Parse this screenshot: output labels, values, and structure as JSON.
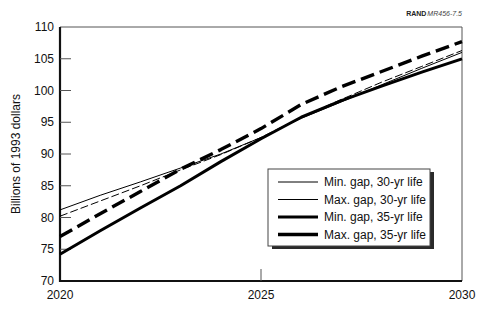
{
  "credit": {
    "org": "RAND",
    "id": "MR456-7.5"
  },
  "chart_data": {
    "type": "line",
    "title": "",
    "xlabel": "",
    "ylabel": "Billions of 1993 dollars",
    "xlim": [
      2020,
      2030
    ],
    "ylim": [
      70,
      110
    ],
    "x_ticks": [
      2020,
      2025,
      2030
    ],
    "y_ticks": [
      70,
      75,
      80,
      85,
      90,
      95,
      100,
      105,
      110
    ],
    "grid": false,
    "legend_position": "lower right",
    "x": [
      2020,
      2021,
      2022,
      2023,
      2024,
      2025,
      2026,
      2027,
      2028,
      2029,
      2030
    ],
    "series": [
      {
        "name": "Min. gap, 30-yr life",
        "style": "thin-solid",
        "values": [
          81.2,
          83.5,
          85.6,
          87.8,
          90.0,
          92.6,
          95.6,
          98.2,
          100.9,
          103.5,
          106.0
        ]
      },
      {
        "name": "Max. gap, 30-yr life",
        "style": "thin-dashed",
        "values": [
          80.2,
          82.6,
          85.0,
          87.5,
          89.9,
          92.6,
          95.8,
          98.6,
          101.3,
          103.8,
          106.3
        ]
      },
      {
        "name": "Min. gap, 35-yr life",
        "style": "thick-solid",
        "values": [
          74.2,
          77.9,
          81.5,
          85.0,
          88.8,
          92.4,
          95.8,
          98.4,
          100.7,
          102.9,
          105.0
        ]
      },
      {
        "name": "Max. gap, 35-yr life",
        "style": "thick-dashed",
        "values": [
          77.0,
          80.6,
          84.1,
          87.6,
          90.7,
          94.0,
          97.8,
          100.6,
          103.0,
          105.4,
          107.7
        ]
      }
    ]
  }
}
